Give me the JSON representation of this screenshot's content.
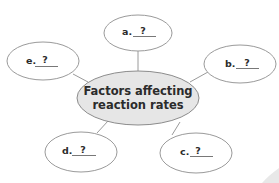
{
  "diagram": {
    "type": "concept-map",
    "center": {
      "line1": "Factors affecting",
      "line2": "reaction rates",
      "fill": "#e6e6e6",
      "stroke": "#8c8c8c"
    },
    "nodes": [
      {
        "id": "a",
        "letter": "a.",
        "blank": "?"
      },
      {
        "id": "b",
        "letter": "b.",
        "blank": "?"
      },
      {
        "id": "c",
        "letter": "c.",
        "blank": "?"
      },
      {
        "id": "d",
        "letter": "d.",
        "blank": "?"
      },
      {
        "id": "e",
        "letter": "e.",
        "blank": "?"
      }
    ],
    "node_fill": "#ffffff",
    "node_stroke": "#9a9a9a",
    "connector_color": "#9a9a9a"
  }
}
